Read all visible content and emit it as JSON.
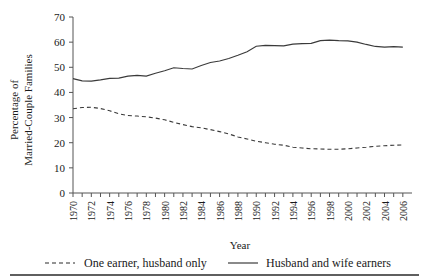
{
  "chart_data": {
    "type": "line",
    "title": "",
    "xlabel": "Year",
    "ylabel": "Percentage of Married-Couple Families",
    "ylabel_line1": "Percentage of",
    "ylabel_line2": "Married-Couple Families",
    "xlim": [
      1970,
      2007
    ],
    "ylim": [
      0,
      70
    ],
    "yticks": [
      0,
      10,
      20,
      30,
      40,
      50,
      60,
      70
    ],
    "ytick_labels": [
      "0",
      "10",
      "20",
      "30",
      "40",
      "50",
      "60",
      "70"
    ],
    "grid": false,
    "legend_position": "below-plot",
    "x": [
      1970,
      1971,
      1972,
      1973,
      1974,
      1975,
      1976,
      1977,
      1978,
      1979,
      1980,
      1981,
      1982,
      1983,
      1984,
      1985,
      1986,
      1987,
      1988,
      1989,
      1990,
      1991,
      1992,
      1993,
      1994,
      1995,
      1996,
      1997,
      1998,
      1999,
      2000,
      2001,
      2002,
      2003,
      2004,
      2005,
      2006
    ],
    "xtick_labels": [
      "1970",
      "1972",
      "1974",
      "1976",
      "1978",
      "1980",
      "1982",
      "1984",
      "1986",
      "1988",
      "1990",
      "1992",
      "1994",
      "1996",
      "1998",
      "2000",
      "2002",
      "2004",
      "2006"
    ],
    "series": [
      {
        "name": "Husband and wife earners",
        "style": "solid",
        "color": "#3a3a3a",
        "values": [
          45.5,
          44.6,
          44.5,
          45.0,
          45.6,
          45.7,
          46.5,
          46.8,
          46.5,
          47.6,
          48.6,
          49.8,
          49.5,
          49.3,
          50.7,
          51.9,
          52.5,
          53.5,
          54.8,
          56.2,
          58.4,
          58.7,
          58.6,
          58.5,
          59.2,
          59.4,
          59.5,
          60.6,
          60.8,
          60.6,
          60.5,
          60.0,
          59.1,
          58.3,
          58.0,
          58.2,
          58.0
        ]
      },
      {
        "name": "One earner, husband only",
        "style": "dashed",
        "color": "#3a3a3a",
        "values": [
          33.5,
          34.0,
          34.1,
          33.6,
          32.7,
          31.5,
          30.8,
          30.6,
          30.3,
          29.8,
          29.1,
          28.1,
          27.2,
          26.4,
          25.9,
          25.2,
          24.4,
          23.5,
          22.3,
          21.5,
          20.6,
          20.0,
          19.4,
          19.0,
          18.2,
          17.9,
          17.6,
          17.5,
          17.4,
          17.4,
          17.6,
          17.9,
          18.2,
          18.6,
          18.8,
          19.0,
          19.1
        ]
      }
    ]
  },
  "axis_titles": {
    "x": "Year"
  },
  "legend": {
    "items": [
      {
        "label": "One earner, husband only",
        "style": "dashed"
      },
      {
        "label": "Husband and wife earners",
        "style": "solid"
      }
    ]
  }
}
